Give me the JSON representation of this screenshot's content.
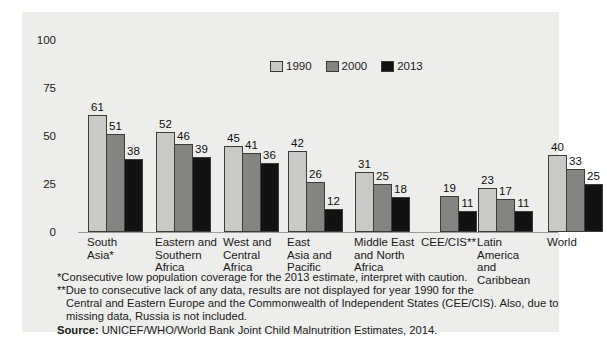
{
  "chart_data": {
    "type": "bar",
    "title": "",
    "subtitle": "",
    "xlabel": "",
    "ylabel": "",
    "ylim": [
      0,
      100
    ],
    "yticks": [
      "0",
      "25",
      "50",
      "75",
      "100"
    ],
    "grid": false,
    "legend_position": "top-center",
    "categories": [
      "South\nAsia*",
      "Eastern and\nSouthern\nAfrica",
      "West and\nCentral\nAfrica",
      "East\nAsia and\nPacific",
      "Middle East\nand North\nAfrica",
      "CEE/CIS**",
      "Latin\nAmerica\nand\nCaribbean",
      "World"
    ],
    "series": [
      {
        "name": "1990",
        "color": "#c9c9c7",
        "values": [
          61,
          52,
          45,
          42,
          31,
          null,
          23,
          40
        ]
      },
      {
        "name": "2000",
        "color": "#848483",
        "values": [
          51,
          46,
          41,
          26,
          25,
          19,
          17,
          33
        ]
      },
      {
        "name": "2013",
        "color": "#121212",
        "values": [
          38,
          39,
          36,
          12,
          18,
          11,
          11,
          25
        ]
      }
    ],
    "annotations": [
      "*Consecutive low population coverage for the 2013 estimate, interpret with caution.",
      "**Due to consecutive lack of any data, results are not displayed for year 1990 for the Central and Eastern Europe and the Commonwealth of Independent States (CEE/CIS). Also, due to missing data, Russia is not included."
    ]
  },
  "legend": {
    "items": [
      {
        "label": "1990"
      },
      {
        "label": "2000"
      },
      {
        "label": "2013"
      }
    ]
  },
  "axis": {
    "yticks": [
      {
        "label": "100"
      },
      {
        "label": "75"
      },
      {
        "label": "50"
      },
      {
        "label": "25"
      },
      {
        "label": "0"
      }
    ]
  },
  "categories": [
    {
      "lines": [
        "South",
        "Asia*"
      ]
    },
    {
      "lines": [
        "Eastern and",
        "Southern",
        "Africa"
      ]
    },
    {
      "lines": [
        "West and",
        "Central",
        "Africa"
      ]
    },
    {
      "lines": [
        "East",
        "Asia and",
        "Pacific"
      ]
    },
    {
      "lines": [
        "Middle East",
        "and North",
        "Africa"
      ]
    },
    {
      "lines": [
        "CEE/CIS**"
      ]
    },
    {
      "lines": [
        "Latin",
        "America",
        "and",
        "Caribbean"
      ]
    },
    {
      "lines": [
        "World"
      ]
    }
  ],
  "footnotes": {
    "note1": "*Consecutive low population coverage for the 2013 estimate, interpret with caution.",
    "note2_line1": "**Due to consecutive lack of any data, results are not displayed for year 1990 for the",
    "note2_line2": "Central and Eastern Europe and the Commonwealth of Independent States (CEE/CIS). Also, due to",
    "note2_line3": "missing data, Russia is not included.",
    "source_label": "Source:",
    "source_text": " UNICEF/WHO/World Bank Joint Child Malnutrition Estimates, 2014."
  },
  "colors": {
    "series_1990": "#c9c9c7",
    "series_2000": "#848483",
    "series_2013": "#121212",
    "panel_background": "#ededeb",
    "bar_outline": "#3c3c3c",
    "text": "#1a1a1a"
  }
}
